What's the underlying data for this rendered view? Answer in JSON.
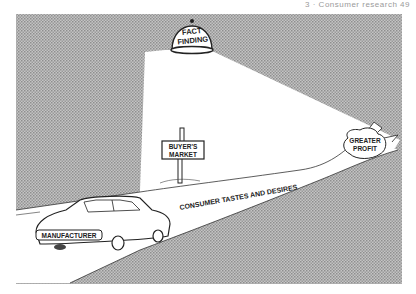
{
  "page": {
    "running_head": "3 · Consumer research   49"
  },
  "illustration": {
    "spotlight_label_line1": "FACT",
    "spotlight_label_line2": "FINDING",
    "sign_line1": "BUYER'S",
    "sign_line2": "MARKET",
    "road_label": "CONSUMER   TASTES   AND DESIRES",
    "goal_line1": "GREATER",
    "goal_line2": "PROFIT",
    "car_label": "MANUFACTURER",
    "colors": {
      "background_halftone": "#b8b8b8",
      "halftone_dot": "#8c8c8c",
      "light_cone": "#ffffff",
      "ink": "#222222"
    }
  }
}
